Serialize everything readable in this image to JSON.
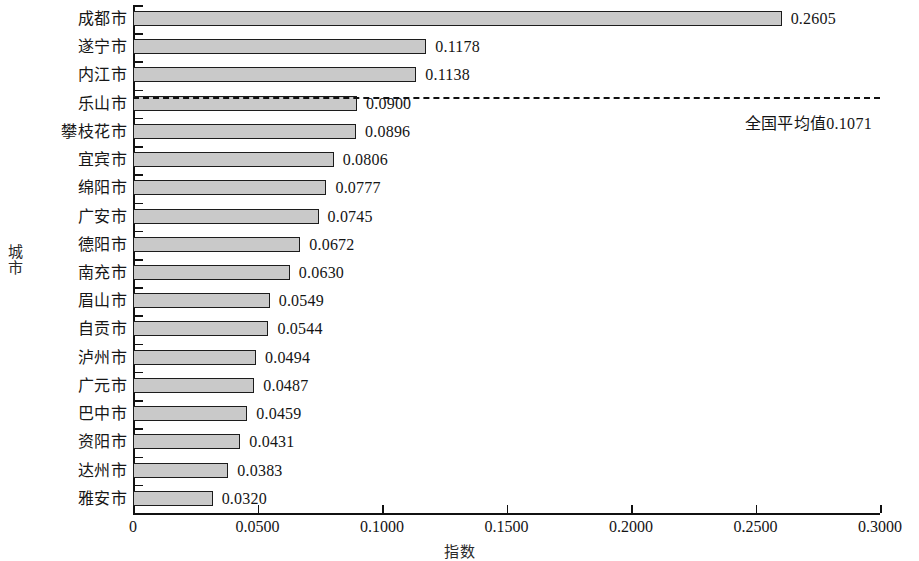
{
  "chart_data": {
    "type": "bar",
    "orientation": "horizontal",
    "title": "",
    "xlabel": "指数",
    "ylabel": "城市",
    "xlim": [
      0,
      0.3
    ],
    "grid": false,
    "legend": null,
    "xticks": [
      "0",
      "0.0500",
      "0.1000",
      "0.1500",
      "0.2000",
      "0.2500",
      "0.3000"
    ],
    "xtick_values": [
      0,
      0.05,
      0.1,
      0.15,
      0.2,
      0.25,
      0.3
    ],
    "categories": [
      "成都市",
      "遂宁市",
      "内江市",
      "乐山市",
      "攀枝花市",
      "宜宾市",
      "绵阳市",
      "广安市",
      "德阳市",
      "南充市",
      "眉山市",
      "自贡市",
      "泸州市",
      "广元市",
      "巴中市",
      "资阳市",
      "达州市",
      "雅安市"
    ],
    "values": [
      0.2605,
      0.1178,
      0.1138,
      0.09,
      0.0896,
      0.0806,
      0.0777,
      0.0745,
      0.0672,
      0.063,
      0.0549,
      0.0544,
      0.0494,
      0.0487,
      0.0459,
      0.0431,
      0.0383,
      0.032
    ],
    "value_labels": [
      "0.2605",
      "0.1178",
      "0.1138",
      "0.0900",
      "0.0896",
      "0.0806",
      "0.0777",
      "0.0745",
      "0.0672",
      "0.0630",
      "0.0549",
      "0.0544",
      "0.0494",
      "0.0487",
      "0.0459",
      "0.0431",
      "0.0383",
      "0.0320"
    ],
    "annotations": [
      {
        "name": "national-average",
        "text": "全国平均值0.1071",
        "value": 0.1071,
        "style": "dashed-horizontal-line"
      }
    ],
    "bar_fill_color": "#c9c9c9",
    "bar_edge_color": "#1c1c1c",
    "axis_color": "#111111"
  }
}
